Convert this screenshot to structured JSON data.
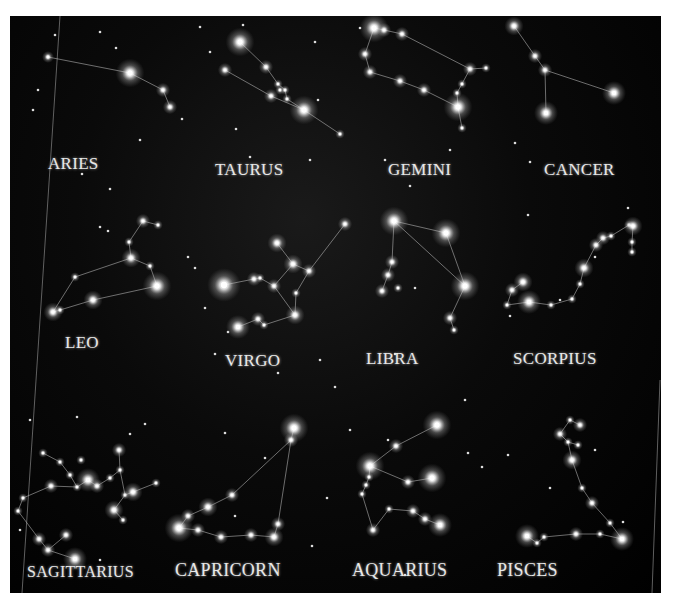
{
  "image": {
    "background_color": "#000000",
    "star_color": "#ffffff",
    "line_color": "#bdbdbd"
  },
  "constellations": [
    {
      "name": "ARIES",
      "label_pos": [
        38,
        140
      ],
      "stars": [
        [
          48,
          57,
          2.5
        ],
        [
          130,
          73,
          6
        ],
        [
          163,
          90,
          3
        ],
        [
          170,
          107,
          3
        ]
      ],
      "lines": [
        [
          0,
          1
        ],
        [
          1,
          2
        ],
        [
          2,
          3
        ]
      ]
    },
    {
      "name": "TAURUS",
      "label_pos": [
        205,
        146
      ],
      "stars": [
        [
          240,
          42,
          6
        ],
        [
          266,
          67,
          3
        ],
        [
          278,
          84,
          2
        ],
        [
          280,
          90,
          2
        ],
        [
          285,
          90,
          2
        ],
        [
          271,
          96,
          3
        ],
        [
          287,
          99,
          2
        ],
        [
          304,
          110,
          6
        ],
        [
          225,
          70,
          3
        ],
        [
          340,
          134,
          2
        ]
      ],
      "lines": [
        [
          0,
          1
        ],
        [
          1,
          2
        ],
        [
          2,
          4
        ],
        [
          4,
          6
        ],
        [
          6,
          7
        ],
        [
          8,
          5
        ],
        [
          5,
          7
        ],
        [
          7,
          9
        ]
      ]
    },
    {
      "name": "GEMINI",
      "label_pos": [
        378,
        146
      ],
      "stars": [
        [
          374,
          28,
          6
        ],
        [
          384,
          30,
          3
        ],
        [
          402,
          34,
          3
        ],
        [
          365,
          54,
          3
        ],
        [
          370,
          72,
          3
        ],
        [
          400,
          81,
          3
        ],
        [
          424,
          90,
          3
        ],
        [
          458,
          107,
          6
        ],
        [
          470,
          69,
          3
        ],
        [
          486,
          68,
          2
        ],
        [
          462,
          84,
          2
        ],
        [
          462,
          128,
          2
        ],
        [
          457,
          93,
          2
        ]
      ],
      "lines": [
        [
          0,
          1
        ],
        [
          1,
          2
        ],
        [
          2,
          8
        ],
        [
          8,
          9
        ],
        [
          0,
          3
        ],
        [
          3,
          4
        ],
        [
          4,
          5
        ],
        [
          5,
          6
        ],
        [
          6,
          7
        ],
        [
          8,
          12
        ],
        [
          12,
          7
        ],
        [
          7,
          11
        ]
      ]
    },
    {
      "name": "CANCER",
      "label_pos": [
        534,
        146
      ],
      "stars": [
        [
          514,
          26,
          4
        ],
        [
          535,
          56,
          3
        ],
        [
          545,
          70,
          3
        ],
        [
          614,
          93,
          5
        ],
        [
          546,
          113,
          5
        ]
      ],
      "lines": [
        [
          0,
          1
        ],
        [
          1,
          2
        ],
        [
          2,
          3
        ],
        [
          2,
          4
        ]
      ]
    },
    {
      "name": "LEO",
      "label_pos": [
        55,
        318
      ],
      "stars": [
        [
          143,
          221,
          3
        ],
        [
          158,
          225,
          2
        ],
        [
          129,
          242,
          2
        ],
        [
          131,
          258,
          4
        ],
        [
          150,
          266,
          2
        ],
        [
          157,
          286,
          6
        ],
        [
          93,
          300,
          4
        ],
        [
          53,
          312,
          4
        ],
        [
          60,
          310,
          2
        ],
        [
          75,
          277,
          2
        ]
      ],
      "lines": [
        [
          0,
          1
        ],
        [
          0,
          2
        ],
        [
          2,
          3
        ],
        [
          3,
          4
        ],
        [
          4,
          5
        ],
        [
          3,
          9
        ],
        [
          9,
          7
        ],
        [
          7,
          8
        ],
        [
          8,
          6
        ],
        [
          6,
          5
        ]
      ]
    },
    {
      "name": "VIRGO",
      "label_pos": [
        215,
        338
      ],
      "stars": [
        [
          224,
          285,
          7
        ],
        [
          254,
          279,
          3
        ],
        [
          260,
          278,
          2
        ],
        [
          274,
          286,
          3
        ],
        [
          277,
          243,
          4
        ],
        [
          293,
          264,
          4
        ],
        [
          309,
          271,
          3
        ],
        [
          345,
          224,
          3
        ],
        [
          296,
          293,
          2
        ],
        [
          295,
          315,
          4
        ],
        [
          258,
          319,
          3
        ],
        [
          264,
          325,
          2
        ],
        [
          238,
          327,
          5
        ]
      ],
      "lines": [
        [
          0,
          1
        ],
        [
          1,
          2
        ],
        [
          2,
          3
        ],
        [
          3,
          5
        ],
        [
          4,
          5
        ],
        [
          5,
          6
        ],
        [
          6,
          7
        ],
        [
          3,
          9
        ],
        [
          6,
          8
        ],
        [
          8,
          9
        ],
        [
          9,
          11
        ],
        [
          11,
          10
        ],
        [
          10,
          12
        ]
      ]
    },
    {
      "name": "LIBRA",
      "label_pos": [
        356,
        336
      ],
      "stars": [
        [
          394,
          221,
          6
        ],
        [
          446,
          233,
          6
        ],
        [
          465,
          286,
          6
        ],
        [
          392,
          262,
          3
        ],
        [
          388,
          275,
          3
        ],
        [
          382,
          291,
          3
        ],
        [
          398,
          288,
          2
        ],
        [
          450,
          318,
          3
        ],
        [
          454,
          330,
          2
        ]
      ],
      "lines": [
        [
          0,
          1
        ],
        [
          1,
          2
        ],
        [
          0,
          2
        ],
        [
          0,
          3
        ],
        [
          3,
          4
        ],
        [
          4,
          5
        ],
        [
          2,
          7
        ],
        [
          7,
          8
        ]
      ]
    },
    {
      "name": "SCORPIUS",
      "label_pos": [
        505,
        336
      ],
      "stars": [
        [
          523,
          282,
          4
        ],
        [
          512,
          290,
          3
        ],
        [
          507,
          305,
          2
        ],
        [
          529,
          302,
          5
        ],
        [
          551,
          305,
          2
        ],
        [
          572,
          299,
          2
        ],
        [
          580,
          284,
          2
        ],
        [
          584,
          268,
          4
        ],
        [
          596,
          245,
          3
        ],
        [
          603,
          238,
          3
        ],
        [
          611,
          236,
          2
        ],
        [
          629,
          225,
          2
        ],
        [
          633,
          226,
          4
        ],
        [
          632,
          242,
          2
        ],
        [
          632,
          252,
          2
        ]
      ],
      "lines": [
        [
          0,
          1
        ],
        [
          1,
          2
        ],
        [
          2,
          3
        ],
        [
          3,
          4
        ],
        [
          4,
          5
        ],
        [
          5,
          6
        ],
        [
          6,
          7
        ],
        [
          7,
          8
        ],
        [
          8,
          9
        ],
        [
          9,
          10
        ],
        [
          10,
          11
        ],
        [
          11,
          12
        ],
        [
          12,
          13
        ],
        [
          13,
          14
        ]
      ]
    },
    {
      "name": "SAGITTARIUS",
      "label_pos": [
        16,
        546
      ],
      "stars": [
        [
          43,
          453,
          2
        ],
        [
          60,
          462,
          2
        ],
        [
          70,
          475,
          2
        ],
        [
          77,
          487,
          2
        ],
        [
          81,
          460,
          2
        ],
        [
          88,
          480,
          5
        ],
        [
          51,
          486,
          3
        ],
        [
          23,
          498,
          2
        ],
        [
          18,
          511,
          2
        ],
        [
          39,
          539,
          3
        ],
        [
          48,
          550,
          3
        ],
        [
          66,
          535,
          3
        ],
        [
          75,
          559,
          5
        ],
        [
          97,
          486,
          3
        ],
        [
          110,
          478,
          2
        ],
        [
          120,
          470,
          2
        ],
        [
          119,
          450,
          3
        ],
        [
          125,
          495,
          2
        ],
        [
          133,
          492,
          4
        ],
        [
          156,
          483,
          2
        ],
        [
          114,
          510,
          4
        ],
        [
          123,
          520,
          2
        ]
      ],
      "lines": [
        [
          0,
          1
        ],
        [
          1,
          2
        ],
        [
          2,
          3
        ],
        [
          3,
          5
        ],
        [
          5,
          13
        ],
        [
          13,
          14
        ],
        [
          14,
          15
        ],
        [
          15,
          16
        ],
        [
          15,
          17
        ],
        [
          17,
          18
        ],
        [
          18,
          19
        ],
        [
          17,
          20
        ],
        [
          20,
          21
        ],
        [
          6,
          3
        ],
        [
          6,
          7
        ],
        [
          7,
          8
        ],
        [
          8,
          9
        ],
        [
          9,
          10
        ],
        [
          10,
          11
        ],
        [
          10,
          12
        ]
      ]
    },
    {
      "name": "CAPRICORN",
      "label_pos": [
        168,
        546
      ],
      "stars": [
        [
          294,
          428,
          6
        ],
        [
          291,
          440,
          3
        ],
        [
          232,
          495,
          3
        ],
        [
          208,
          507,
          4
        ],
        [
          188,
          516,
          3
        ],
        [
          179,
          528,
          6
        ],
        [
          198,
          530,
          3
        ],
        [
          221,
          537,
          3
        ],
        [
          251,
          535,
          3
        ],
        [
          274,
          537,
          4
        ],
        [
          278,
          524,
          3
        ]
      ],
      "lines": [
        [
          0,
          1
        ],
        [
          1,
          2
        ],
        [
          2,
          3
        ],
        [
          3,
          4
        ],
        [
          4,
          5
        ],
        [
          5,
          6
        ],
        [
          6,
          7
        ],
        [
          7,
          8
        ],
        [
          8,
          9
        ],
        [
          9,
          10
        ],
        [
          10,
          1
        ]
      ]
    },
    {
      "name": "AQUARIUS",
      "label_pos": [
        342,
        546
      ],
      "stars": [
        [
          437,
          425,
          6
        ],
        [
          396,
          446,
          3
        ],
        [
          370,
          466,
          6
        ],
        [
          408,
          482,
          3
        ],
        [
          432,
          478,
          6
        ],
        [
          369,
          477,
          2
        ],
        [
          366,
          485,
          2
        ],
        [
          362,
          494,
          2
        ],
        [
          373,
          530,
          3
        ],
        [
          389,
          509,
          2
        ],
        [
          413,
          511,
          3
        ],
        [
          425,
          519,
          3
        ],
        [
          440,
          525,
          5
        ]
      ],
      "lines": [
        [
          0,
          1
        ],
        [
          1,
          2
        ],
        [
          2,
          3
        ],
        [
          3,
          4
        ],
        [
          2,
          5
        ],
        [
          5,
          6
        ],
        [
          6,
          7
        ],
        [
          7,
          8
        ],
        [
          8,
          9
        ],
        [
          9,
          10
        ],
        [
          10,
          11
        ],
        [
          11,
          12
        ]
      ]
    },
    {
      "name": "PISCES",
      "label_pos": [
        490,
        546
      ],
      "stars": [
        [
          570,
          420,
          2
        ],
        [
          580,
          425,
          3
        ],
        [
          560,
          434,
          3
        ],
        [
          568,
          442,
          2
        ],
        [
          578,
          445,
          2
        ],
        [
          572,
          460,
          4
        ],
        [
          582,
          488,
          2
        ],
        [
          592,
          503,
          3
        ],
        [
          610,
          523,
          2
        ],
        [
          622,
          539,
          5
        ],
        [
          600,
          534,
          2
        ],
        [
          576,
          534,
          3
        ],
        [
          544,
          537,
          2
        ],
        [
          527,
          536,
          5
        ],
        [
          537,
          543,
          2
        ]
      ],
      "lines": [
        [
          0,
          1
        ],
        [
          0,
          2
        ],
        [
          2,
          3
        ],
        [
          3,
          4
        ],
        [
          3,
          5
        ],
        [
          5,
          6
        ],
        [
          6,
          7
        ],
        [
          7,
          8
        ],
        [
          8,
          9
        ],
        [
          9,
          10
        ],
        [
          10,
          11
        ],
        [
          11,
          12
        ],
        [
          12,
          14
        ],
        [
          14,
          13
        ]
      ]
    }
  ],
  "background_stars": [
    [
      55,
      35
    ],
    [
      100,
      32
    ],
    [
      116,
      48
    ],
    [
      38,
      90
    ],
    [
      33,
      110
    ],
    [
      200,
      27
    ],
    [
      210,
      52
    ],
    [
      243,
      25
    ],
    [
      315,
      42
    ],
    [
      318,
      100
    ],
    [
      140,
      140
    ],
    [
      82,
      174
    ],
    [
      110,
      189
    ],
    [
      182,
      119
    ],
    [
      236,
      129
    ],
    [
      250,
      157
    ],
    [
      310,
      160
    ],
    [
      360,
      28
    ],
    [
      385,
      160
    ],
    [
      410,
      186
    ],
    [
      450,
      150
    ],
    [
      515,
      143
    ],
    [
      530,
      162
    ],
    [
      528,
      215
    ],
    [
      560,
      300
    ],
    [
      595,
      257
    ],
    [
      628,
      208
    ],
    [
      100,
      227
    ],
    [
      108,
      231
    ],
    [
      188,
      257
    ],
    [
      195,
      268
    ],
    [
      205,
      308
    ],
    [
      228,
      332
    ],
    [
      215,
      354
    ],
    [
      278,
      373
    ],
    [
      320,
      360
    ],
    [
      335,
      387
    ],
    [
      415,
      288
    ],
    [
      395,
      354
    ],
    [
      510,
      316
    ],
    [
      465,
      400
    ],
    [
      350,
      430
    ],
    [
      388,
      440
    ],
    [
      468,
      453
    ],
    [
      508,
      455
    ],
    [
      482,
      467
    ],
    [
      550,
      488
    ],
    [
      595,
      450
    ],
    [
      623,
      522
    ],
    [
      145,
      424
    ],
    [
      77,
      417
    ],
    [
      130,
      434
    ],
    [
      225,
      433
    ],
    [
      265,
      458
    ],
    [
      327,
      498
    ],
    [
      235,
      516
    ],
    [
      312,
      546
    ],
    [
      405,
      575
    ],
    [
      30,
      420
    ],
    [
      20,
      530
    ],
    [
      100,
      560
    ]
  ]
}
